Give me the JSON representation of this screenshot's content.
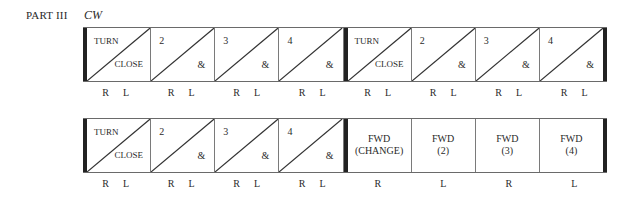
{
  "header": {
    "part": "PART III",
    "direction": "CW"
  },
  "rows": [
    {
      "cells": [
        {
          "type": "split",
          "top_left": "TURN",
          "bottom_right": "CLOSE"
        },
        {
          "type": "split",
          "top_left": "2",
          "bottom_right": "&"
        },
        {
          "type": "split",
          "top_left": "3",
          "bottom_right": "&"
        },
        {
          "type": "split",
          "top_left": "4",
          "bottom_right": "&"
        },
        {
          "type": "split",
          "top_left": "TURN",
          "bottom_right": "CLOSE"
        },
        {
          "type": "split",
          "top_left": "2",
          "bottom_right": "&"
        },
        {
          "type": "split",
          "top_left": "3",
          "bottom_right": "&"
        },
        {
          "type": "split",
          "top_left": "4",
          "bottom_right": "&"
        }
      ],
      "feet": [
        [
          "R",
          "L"
        ],
        [
          "R",
          "L"
        ],
        [
          "R",
          "L"
        ],
        [
          "R",
          "L"
        ],
        [
          "R",
          "L"
        ],
        [
          "R",
          "L"
        ],
        [
          "R",
          "L"
        ],
        [
          "R",
          "L"
        ]
      ]
    },
    {
      "cells": [
        {
          "type": "split",
          "top_left": "TURN",
          "bottom_right": "CLOSE"
        },
        {
          "type": "split",
          "top_left": "2",
          "bottom_right": "&"
        },
        {
          "type": "split",
          "top_left": "3",
          "bottom_right": "&"
        },
        {
          "type": "split",
          "top_left": "4",
          "bottom_right": "&"
        },
        {
          "type": "full",
          "line1": "FWD",
          "line2": "(CHANGE)"
        },
        {
          "type": "full",
          "line1": "FWD",
          "line2": "(2)"
        },
        {
          "type": "full",
          "line1": "FWD",
          "line2": "(3)"
        },
        {
          "type": "full",
          "line1": "FWD",
          "line2": "(4)"
        }
      ],
      "feet": [
        [
          "R",
          "L"
        ],
        [
          "R",
          "L"
        ],
        [
          "R",
          "L"
        ],
        [
          "R",
          "L"
        ],
        [
          "R"
        ],
        [
          "L"
        ],
        [
          "R"
        ],
        [
          "L"
        ]
      ]
    }
  ]
}
